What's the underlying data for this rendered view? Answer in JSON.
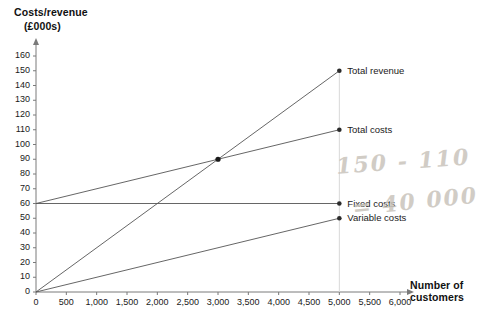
{
  "chart_data": {
    "type": "line",
    "title": "",
    "ylabel_line1": "Costs/revenue",
    "ylabel_line2": "(£000s)",
    "xlabel_line1": "Number of",
    "xlabel_line2": "customers",
    "xlim": [
      0,
      6000
    ],
    "ylim": [
      0,
      160
    ],
    "xticks": [
      0,
      500,
      1000,
      1500,
      2000,
      2500,
      3000,
      3500,
      4000,
      4500,
      5000,
      5500,
      6000
    ],
    "xticklabels": [
      "0",
      "500",
      "1,000",
      "1,500",
      "2,000",
      "2,500",
      "3,000",
      "3,500",
      "4,000",
      "4,500",
      "5,000",
      "5,500",
      "6,000"
    ],
    "yticks": [
      0,
      10,
      20,
      30,
      40,
      50,
      60,
      70,
      80,
      90,
      100,
      110,
      120,
      130,
      140,
      150,
      160
    ],
    "yticklabels": [
      "0",
      "10",
      "20",
      "30",
      "40",
      "50",
      "60",
      "70",
      "80",
      "90",
      "100",
      "110",
      "120",
      "130",
      "140",
      "150",
      "160"
    ],
    "grid": false,
    "legend_position": "inline-right-of-series",
    "series": [
      {
        "name": "Total revenue",
        "x": [
          0,
          5000
        ],
        "values": [
          0,
          150
        ],
        "endpoint_marker": true
      },
      {
        "name": "Total costs",
        "x": [
          0,
          5000
        ],
        "values": [
          60,
          110
        ],
        "endpoint_marker": true
      },
      {
        "name": "Fixed costs",
        "x": [
          0,
          5000
        ],
        "values": [
          60,
          60
        ],
        "endpoint_marker": true
      },
      {
        "name": "Variable costs",
        "x": [
          0,
          5000
        ],
        "values": [
          0,
          50
        ],
        "endpoint_marker": true
      }
    ],
    "annotations": [
      {
        "name": "breakeven-point",
        "x": 3000,
        "y": 90,
        "marker": true,
        "label": ""
      },
      {
        "name": "vertical-guide",
        "x": 5000,
        "y_from": 0,
        "y_to": 150
      }
    ],
    "handwritten_notes": [
      {
        "id": "note-subtraction",
        "text": "150 - 110"
      },
      {
        "id": "note-result",
        "text": "= 40 000"
      }
    ],
    "colors": {
      "line": "#555555",
      "axis": "#7a7a7a",
      "text": "#1a1a1a",
      "handwriting": "#c9c4bc",
      "background": "#ffffff"
    }
  }
}
